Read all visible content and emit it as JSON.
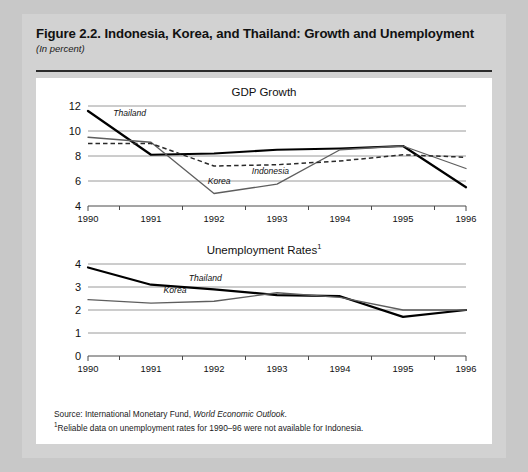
{
  "figure": {
    "title": "Figure 2.2.  Indonesia, Korea, and Thailand: Growth and Unemployment",
    "subtitle": "(In percent)"
  },
  "source": {
    "prefix": "Source: International Monetary Fund, ",
    "publication": "World Economic Outlook",
    "suffix": ".",
    "footnote_marker": "1",
    "footnote": "Reliable data on unemployment rates for 1990–96 were not available for Indonesia."
  },
  "colors": {
    "thailand": "#000000",
    "korea": "#5e5e5e",
    "indonesia": "#2a2a2a",
    "gridline": "#9a9a9a",
    "panel_background": "#ffffff",
    "card_background": "#d2d2d2",
    "page_background": "#c8c8c8"
  },
  "chart_data": [
    {
      "type": "line",
      "title": "GDP Growth",
      "title_superscript": "",
      "xlabel": "",
      "ylabel": "",
      "x": [
        "1990",
        "1991",
        "1992",
        "1993",
        "1994",
        "1995",
        "1996"
      ],
      "categories": [
        "1990",
        "1991",
        "1992",
        "1993",
        "1994",
        "1995",
        "1996"
      ],
      "xticklabels": [
        "1990",
        "1991",
        "1992",
        "1993",
        "1994",
        "1995",
        "1996"
      ],
      "yticks": [
        4,
        6,
        8,
        10,
        12
      ],
      "yticklabels": [
        "4",
        "6",
        "8",
        "10",
        "12"
      ],
      "ylim": [
        4,
        12
      ],
      "grid": true,
      "legend": "inline-labels",
      "series": [
        {
          "name": "Thailand",
          "label": "Thailand",
          "color": "#000000",
          "style": "solid-bold",
          "values": [
            11.6,
            8.1,
            8.2,
            8.5,
            8.6,
            8.8,
            5.5
          ],
          "label_position": {
            "x": "1990.4",
            "y": 11.2
          }
        },
        {
          "name": "Korea",
          "label": "Korea",
          "color": "#5e5e5e",
          "style": "solid-thin",
          "values": [
            9.5,
            9.1,
            5.0,
            5.75,
            8.5,
            8.8,
            7.0
          ],
          "label_position": {
            "x": "1991.9",
            "y": 5.75
          }
        },
        {
          "name": "Indonesia",
          "label": "Indonesia",
          "color": "#2a2a2a",
          "style": "dashed",
          "values": [
            9.0,
            9.0,
            7.2,
            7.3,
            7.6,
            8.1,
            7.9
          ],
          "label_position": {
            "x": "1992.6",
            "y": 6.6
          }
        }
      ]
    },
    {
      "type": "line",
      "title": "Unemployment Rates",
      "title_superscript": "1",
      "xlabel": "",
      "ylabel": "",
      "x": [
        "1990",
        "1991",
        "1992",
        "1993",
        "1994",
        "1995",
        "1996"
      ],
      "categories": [
        "1990",
        "1991",
        "1992",
        "1993",
        "1994",
        "1995",
        "1996"
      ],
      "xticklabels": [
        "1990",
        "1991",
        "1992",
        "1993",
        "1994",
        "1995",
        "1996"
      ],
      "yticks": [
        0,
        1,
        2,
        3,
        4
      ],
      "yticklabels": [
        "0",
        "1",
        "2",
        "3",
        "4"
      ],
      "ylim": [
        0,
        4
      ],
      "grid": true,
      "legend": "inline-labels",
      "series": [
        {
          "name": "Thailand",
          "label": "Thailand",
          "color": "#000000",
          "style": "solid-bold",
          "values": [
            3.85,
            3.1,
            2.9,
            2.65,
            2.6,
            1.7,
            2.0
          ],
          "label_position": {
            "x": "1991.6",
            "y": 3.25
          }
        },
        {
          "name": "Korea",
          "label": "Korea",
          "color": "#5e5e5e",
          "style": "solid-thin",
          "values": [
            2.45,
            2.3,
            2.38,
            2.75,
            2.55,
            2.0,
            2.0
          ],
          "label_position": {
            "x": "1991.2",
            "y": 2.72
          }
        }
      ]
    }
  ]
}
